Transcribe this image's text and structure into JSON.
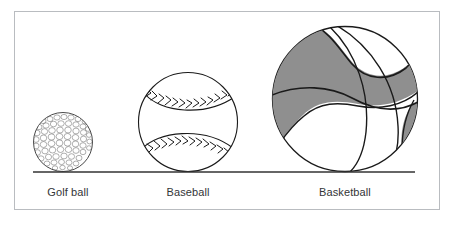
{
  "figure": {
    "border_color": "#b9bcc0",
    "background_color": "#ffffff",
    "ink_color": "#1a1a1a",
    "shade_color": "#8f8f8f",
    "baseline": {
      "name": "ground-line",
      "x1": 33,
      "x2": 415,
      "y": 172,
      "color": "#333333"
    }
  },
  "items": [
    {
      "id": "golf-ball",
      "label": "Golf ball",
      "center_x": 63,
      "center_y": 142,
      "radius": 30,
      "texture": "dimpled"
    },
    {
      "id": "baseball",
      "label": "Baseball",
      "center_x": 188,
      "center_y": 122,
      "radius": 50,
      "texture": "stitched"
    },
    {
      "id": "basketball",
      "label": "Basketball",
      "center_x": 345,
      "center_y": 99,
      "radius": 73,
      "texture": "paneled-shaded"
    }
  ]
}
